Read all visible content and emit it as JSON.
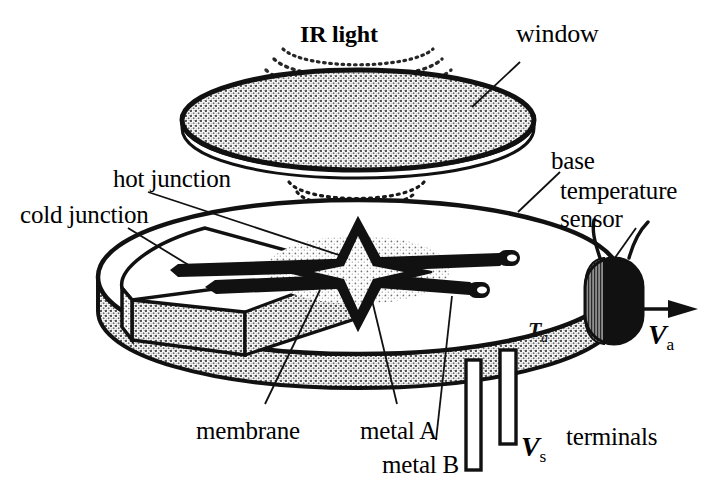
{
  "figure": {
    "type": "technical-line-drawing",
    "background_color": "#ffffff",
    "ink_color": "#111111",
    "fill_gray": "#9a9a9a",
    "fill_gray_light": "#b9b9b9"
  },
  "labels": {
    "ir_light": "IR light",
    "window": "window",
    "base": "base",
    "temperature_sensor_line1": "temperature",
    "temperature_sensor_line2": "sensor",
    "hot_junction": "hot junction",
    "cold_junction": "cold junction",
    "membrane": "membrane",
    "metal_a": "metal A",
    "metal_b": "metal B",
    "terminals": "terminals"
  },
  "symbols": {
    "output_voltage": "V",
    "output_voltage_sub": "a",
    "supply_voltage": "V",
    "supply_voltage_sub": "s",
    "ambient_temperature": "T",
    "ambient_temperature_sub": "a"
  },
  "parts": [
    {
      "name": "window",
      "shape": "ellipse-disc",
      "fill": "stippled-gray"
    },
    {
      "name": "base",
      "shape": "ellipse-disc-with-cutaway-wedge",
      "fill": "stippled-gray"
    },
    {
      "name": "membrane",
      "shape": "ellipse-patch",
      "fill": "stippled-gray"
    },
    {
      "name": "thermopile-star",
      "shape": "four-point-star",
      "fill": "black"
    },
    {
      "name": "contact-pad-upper",
      "shape": "rounded-pad",
      "fill": "black"
    },
    {
      "name": "contact-pad-lower",
      "shape": "rounded-pad",
      "fill": "black"
    },
    {
      "name": "temperature-sensor",
      "shape": "vertical-pill",
      "fill": "black"
    },
    {
      "name": "terminal-pin-left",
      "shape": "outlined-rectangle",
      "fill": "white"
    },
    {
      "name": "terminal-pin-right",
      "shape": "outlined-rectangle",
      "fill": "white"
    },
    {
      "name": "ir-wavefront-arcs-upper",
      "shape": "dotted-arcs",
      "count": 3
    },
    {
      "name": "ir-wavefront-arcs-lower",
      "shape": "dotted-arcs",
      "count": 4
    }
  ]
}
